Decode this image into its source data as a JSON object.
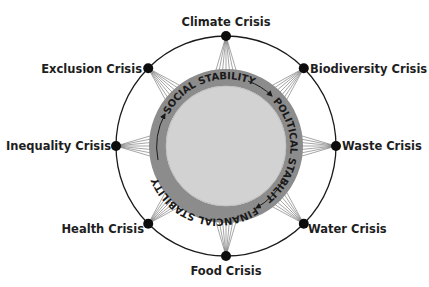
{
  "diagram": {
    "center": {
      "x": 226,
      "y": 146
    },
    "outer_radius": 110,
    "ring_outer_radius": 77,
    "ring_inner_radius": 60,
    "colors": {
      "outer_circle": "#1a1a1a",
      "node": "#0d0d0d",
      "ring": "#8c8c8c",
      "inner_disc": "#d2d2d2",
      "spokes": "#6a6a6a",
      "arrows": "#1a1a1a"
    },
    "center_ring": {
      "segments": [
        {
          "label": "SOCIAL STABILITY"
        },
        {
          "label": "POLITICAL STABILITY"
        },
        {
          "label": "FINANCIAL STABILITY"
        }
      ],
      "flow_direction": "clockwise"
    },
    "crises": [
      {
        "label": "Climate Crisis",
        "angle": -90
      },
      {
        "label": "Biodiversity Crisis",
        "angle": -45
      },
      {
        "label": "Waste Crisis",
        "angle": 0
      },
      {
        "label": "Water Crisis",
        "angle": 45
      },
      {
        "label": "Food Crisis",
        "angle": 90
      },
      {
        "label": "Health Crisis",
        "angle": 135
      },
      {
        "label": "Inequality Crisis",
        "angle": 180
      },
      {
        "label": "Exclusion Crisis",
        "angle": -135
      }
    ]
  }
}
